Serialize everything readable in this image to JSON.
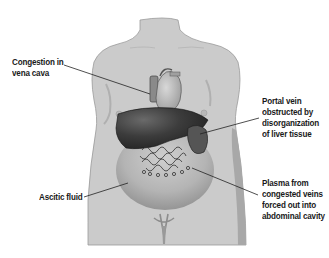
{
  "diagram": {
    "labels": [
      {
        "id": "vena-cava",
        "lines": [
          "Congestion in",
          "vena cava"
        ]
      },
      {
        "id": "portal-vein",
        "lines": [
          "Portal vein",
          "obstructed by",
          "disorganization",
          "of liver tissue"
        ]
      },
      {
        "id": "ascitic-fluid",
        "lines": [
          "Ascitic fluid"
        ]
      },
      {
        "id": "plasma",
        "lines": [
          "Plasma from",
          "congested veins",
          "forced out into",
          "abdominal cavity"
        ]
      }
    ],
    "colors": {
      "skin": "#c9c9c9",
      "skin_shadow": "#a9a9a9",
      "liver": "#3a3a3a",
      "heart": "#b5b5b5",
      "fluid": "#9a9a9a",
      "leader_line": "#222222",
      "text": "#1a1a1a"
    }
  }
}
